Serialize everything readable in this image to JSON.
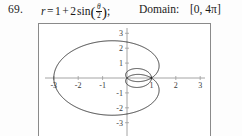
{
  "problem": {
    "number": "69.",
    "equation": {
      "lhs": "r",
      "equals": "=",
      "term1": "1",
      "plus": "+",
      "coefficient": "2",
      "function": "sin",
      "argument_numerator": "θ",
      "argument_denominator": "2",
      "paren_open": "(",
      "paren_close": ")",
      "semicolon": ";",
      "plain_text": "r = 1 + 2 sin(θ/2)"
    },
    "domain_label": "Domain:",
    "domain_value": "[0, 4π]"
  },
  "chart_data": {
    "type": "line",
    "subtype": "polar-curve",
    "title": "",
    "xlabel": "",
    "ylabel": "",
    "equation": "r = 1 + 2 sin(theta/2)",
    "theta_domain": [
      0,
      12.566370614359172
    ],
    "theta_domain_label": "[0, 4π]",
    "xlim": [
      -3.6,
      3.6
    ],
    "ylim": [
      -3.4,
      3.4
    ],
    "xticks": [
      -3,
      -2,
      -1,
      1,
      2,
      3
    ],
    "yticks": [
      3,
      2,
      1,
      -1,
      -2,
      -3
    ],
    "xtick_labels": [
      "-3",
      "-2",
      "-1",
      "1",
      "2",
      "3"
    ],
    "ytick_labels": [
      "3",
      "2",
      "1",
      "-1",
      "-2",
      "-3"
    ],
    "grid": false,
    "legend": null,
    "axes_color": "#9a9a9a",
    "curve_color": "#1c1c1c",
    "frame_color": "#8a8a8a",
    "background": "#ffffff",
    "features": {
      "max_r": 3,
      "min_r": -1,
      "outer_loop_extent_x": [
        -3.0,
        1.0
      ],
      "outer_loop_extent_y": [
        -2.6,
        2.6
      ],
      "inner_loop_extent_x": [
        -0.05,
        1.0
      ],
      "inner_loop_extent_y": [
        -0.55,
        0.55
      ],
      "description": "Large leftward-opening loop reaching x = -3 with small inner loop near origin extending to x = 1"
    }
  }
}
